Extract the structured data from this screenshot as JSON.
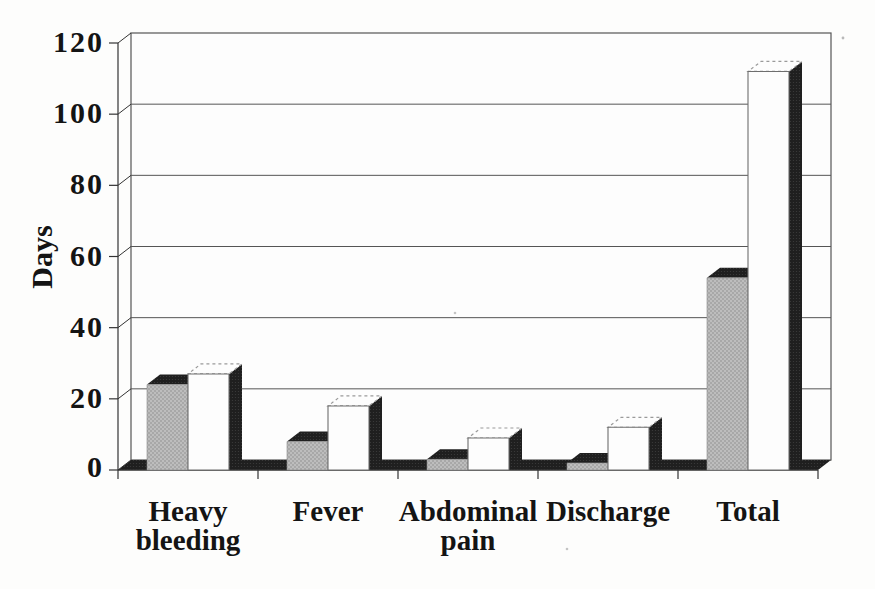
{
  "chart_data": {
    "type": "bar",
    "style": "3d-column, scanned black-and-white print, no legend, no title",
    "title": "",
    "ylabel": "Days",
    "xlabel": "",
    "ylim": [
      0,
      120
    ],
    "yticks": [
      0,
      20,
      40,
      60,
      80,
      100,
      120
    ],
    "grid": true,
    "legend_position": "none",
    "categories": [
      "Heavy bleeding",
      "Fever",
      "Abdominal pain",
      "Discharge",
      "Total"
    ],
    "category_label_lines": [
      [
        "Heavy",
        "bleeding"
      ],
      [
        "Fever"
      ],
      [
        "Abdominal",
        "pain"
      ],
      [
        "Discharge"
      ],
      [
        "Total"
      ]
    ],
    "series": [
      {
        "name": "series-1",
        "appearance": "halftone-gray",
        "color": "#bdbdbd",
        "values": [
          24,
          8,
          3,
          2,
          54
        ]
      },
      {
        "name": "series-2",
        "appearance": "white",
        "color": "#fdfdfd",
        "values": [
          27,
          18,
          9,
          12,
          112
        ]
      }
    ],
    "colors": {
      "shadow_faces": "#1f1f1f",
      "gridline": "#555555",
      "axis": "#333333",
      "text": "#141414",
      "background": "#fdfdfc"
    }
  }
}
